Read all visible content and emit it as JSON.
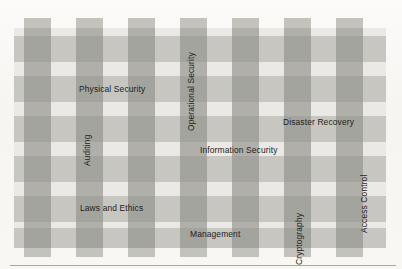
{
  "figure": {
    "kind": "plaid-overlay-diagram",
    "title_visible": false
  },
  "colors": {
    "page_background": "#f7f6f3",
    "panel_light": "#eae9e5",
    "stripe": "#c3c2bd",
    "band_overlay": "rgba(150,149,143,0.42)",
    "label_text": "#1d1d1b",
    "rule": "#a8a7a2"
  },
  "pattern": {
    "vertical_stripe_count": 7,
    "horizontal_band_count": 6,
    "vertical_stripe_x": [
      10,
      62,
      114,
      166,
      218,
      270,
      322
    ],
    "vertical_stripe_width": 27,
    "horizontal_band_y": [
      8,
      48,
      88,
      128,
      168,
      200
    ],
    "horizontal_band_height": 26
  },
  "labels": [
    {
      "id": "physical-security",
      "text": "Physical Security",
      "orientation": "horizontal",
      "x": 65,
      "y": 67
    },
    {
      "id": "operational-security",
      "text": "Operational Security",
      "orientation": "vertical",
      "x": 173,
      "y": 113
    },
    {
      "id": "disaster-recovery",
      "text": "Disaster Recovery",
      "orientation": "horizontal",
      "x": 269,
      "y": 100
    },
    {
      "id": "auditing",
      "text": "Auditing",
      "orientation": "vertical",
      "x": 69,
      "y": 148
    },
    {
      "id": "information-security",
      "text": "Information Security",
      "orientation": "horizontal",
      "x": 186,
      "y": 128
    },
    {
      "id": "access-control",
      "text": "Access Control",
      "orientation": "vertical",
      "x": 346,
      "y": 215
    },
    {
      "id": "laws-and-ethics",
      "text": "Laws and Ethics",
      "orientation": "horizontal",
      "x": 66,
      "y": 186
    },
    {
      "id": "management",
      "text": "Management",
      "orientation": "horizontal",
      "x": 176,
      "y": 212
    },
    {
      "id": "cryptography",
      "text": "Cryptography",
      "orientation": "vertical",
      "x": 281,
      "y": 247
    }
  ]
}
